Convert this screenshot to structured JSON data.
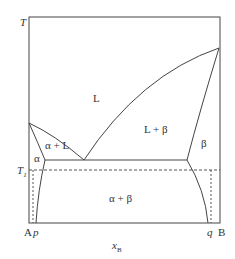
{
  "diagram": {
    "type": "binary eutectic phase diagram",
    "axis": {
      "y_label": "T",
      "x_label": "x",
      "x_label_sub": "B",
      "left_component": "A",
      "right_component": "B",
      "marker_T1": "T",
      "marker_T1_sub": "1",
      "marker_p": "p",
      "marker_q": "q"
    },
    "regions": {
      "liquid": "L",
      "liquid_beta": "L + β",
      "alpha_liquid": "α + L",
      "alpha": "α",
      "beta": "β",
      "alpha_beta": "α + β"
    },
    "colors": {
      "line": "#444444",
      "text": "#333333",
      "background": "#ffffff"
    }
  }
}
